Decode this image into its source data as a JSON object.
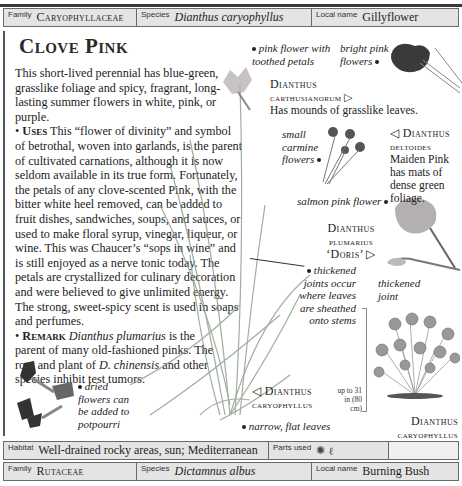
{
  "header": {
    "family_label": "Family",
    "family_value": "Caryophyllaceae",
    "species_label": "Species",
    "species_value": "Dianthus caryophyllus",
    "local_label": "Local name",
    "local_value": "Gillyflower"
  },
  "entry": {
    "title": "Clove Pink",
    "intro": "This short-lived perennial has blue-green, grasslike foliage and spicy, fragrant, long-lasting summer flowers in white, pink, or purple.",
    "uses_heading": "Uses",
    "uses_text": "This “flower of divinity” and symbol of betrothal, woven into garlands, is the parent of cultivated carnations, although it is now seldom available in its true form. Fortunately, the petals of any clove-scented Pink, with the bitter white heel removed, can be added to fruit dishes, sandwiches, soups, and sauces, or used to make floral syrup, vinegar, liqueur, or wine. This was Chaucer’s “sops in wine” and is still enjoyed as a nerve tonic today. The petals are crystallized for culinary decoration and were believed to give unlimited energy. The strong, sweet-spicy scent is used in soaps and perfumes.",
    "remark_heading": "Remark",
    "remark_species1": "Dianthus plumarius",
    "remark_text1": "is the parent of many old-fashioned pinks. The root and plant of",
    "remark_species2": "D. chinensis",
    "remark_text2": "and other species inhibit test tumors."
  },
  "annotations": {
    "pink_flower": "pink flower with toothed petals",
    "bright_pink": "bright pink flowers",
    "small_carmine": "small carmine flowers",
    "salmon_pink": "salmon pink flower",
    "thickened_joints": "thickened joints occur where leaves are sheathed onto stems",
    "thickened_joint": "thickened joint",
    "dried_flowers": "dried flowers can be added to potpourri",
    "narrow_leaves": "narrow, flat leaves"
  },
  "labels": {
    "carthusianorum_name1": "Dianthus",
    "carthusianorum_name2": "carthusianorum ▷",
    "carthusianorum_desc": "Has mounds of grasslike leaves.",
    "deltoides_name1": "◁ Dianthus",
    "deltoides_name2": "deltoides",
    "deltoides_desc": "Maiden Pink has mats of dense green foliage.",
    "plumarius_name1": "Dianthus",
    "plumarius_name2": "plumarius",
    "plumarius_name3": "‘Doris’ ▷",
    "caryophyllus_name1": "◁ Dianthus",
    "caryophyllus_name2": "caryophyllus",
    "height_note": "up to 31 in (80 cm)",
    "habit_name1": "Dianthus",
    "habit_name2": "caryophyllus"
  },
  "footer": {
    "habitat_label": "Habitat",
    "habitat_value": "Well-drained rocky areas, sun; Mediterranean",
    "parts_label": "Parts used",
    "parts_icons": [
      "flower-icon",
      "leaf-stem-icon"
    ]
  },
  "next_entry": {
    "family_label": "Family",
    "family_value": "Rutaceae",
    "species_label": "Species",
    "species_value": "Dictamnus albus",
    "local_label": "Local name",
    "local_value": "Burning Bush"
  },
  "colors": {
    "bar_bg": "#e4e4e4",
    "border": "#6a6a6a",
    "text": "#222222"
  }
}
